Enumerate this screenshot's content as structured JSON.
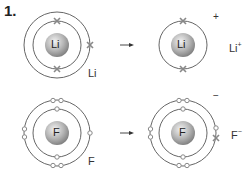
{
  "question_number": "1.",
  "colors": {
    "shell": "#555555",
    "nucleus_light": "#f0f0f0",
    "nucleus_dark": "#8a8a8a",
    "electron": "#888888",
    "text": "#333333"
  },
  "rows": [
    {
      "atom": {
        "symbol": "Li",
        "label": "Li",
        "shells": [
          {
            "electrons": 2,
            "marker": "cross"
          },
          {
            "electrons": 1,
            "marker": "cross"
          }
        ]
      },
      "arrow": "→",
      "ion": {
        "symbol": "Li",
        "label": "Li",
        "charge": "+",
        "bracket_charge": "+",
        "shells": [
          {
            "electrons": 2,
            "marker": "cross"
          }
        ]
      }
    },
    {
      "atom": {
        "symbol": "F",
        "label": "F",
        "shells": [
          {
            "electrons": 2,
            "marker": "dot"
          },
          {
            "electrons": 7,
            "marker": "dot"
          }
        ]
      },
      "arrow": "→",
      "ion": {
        "symbol": "F",
        "label": "F",
        "charge": "−",
        "bracket_charge": "−",
        "shells": [
          {
            "electrons": 2,
            "marker": "dot"
          },
          {
            "electrons": 8,
            "marker": "7 dots + 1 cross"
          }
        ]
      }
    }
  ]
}
